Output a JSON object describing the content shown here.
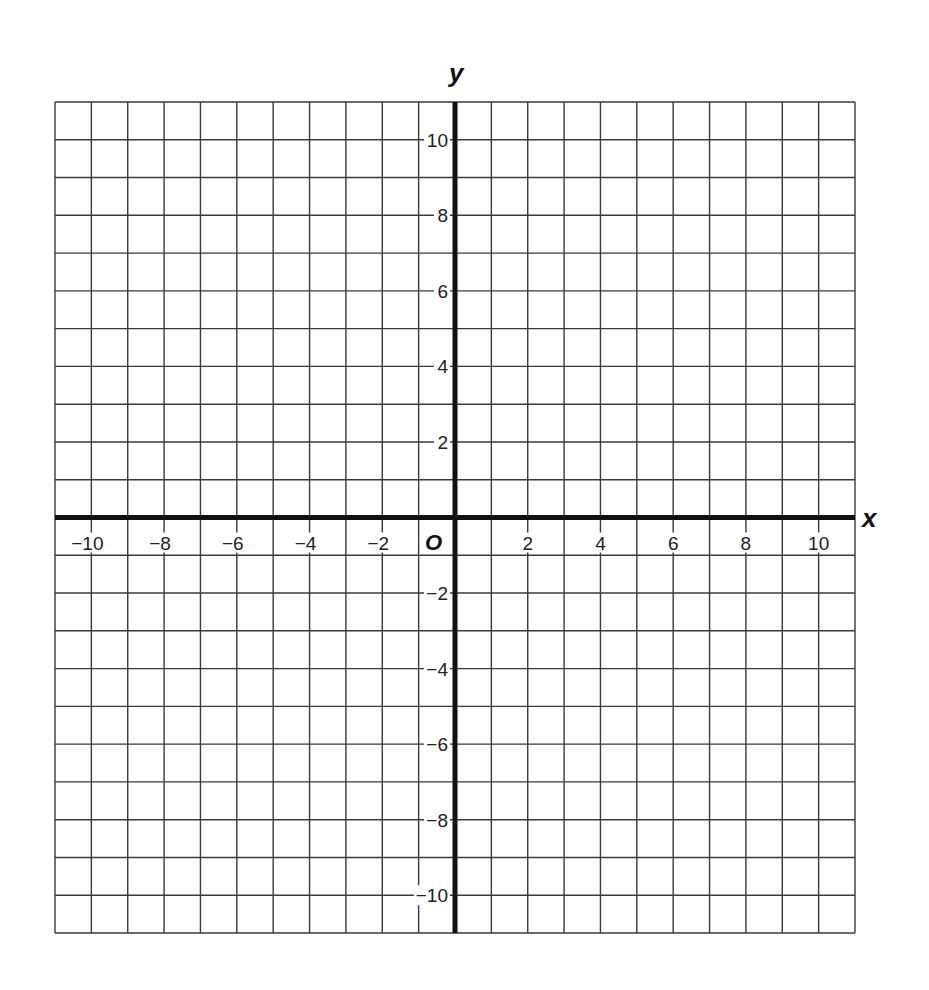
{
  "chart_data": {
    "type": "scatter",
    "title": "",
    "xlabel": "x",
    "ylabel": "y",
    "origin_label": "O",
    "xlim": [
      -11,
      11
    ],
    "ylim": [
      -11,
      11
    ],
    "grid": true,
    "grid_step": 1,
    "x_ticks": [
      -10,
      -8,
      -6,
      -4,
      -2,
      2,
      4,
      6,
      8,
      10
    ],
    "y_ticks": [
      10,
      8,
      6,
      4,
      2,
      -2,
      -4,
      -6,
      -8,
      -10
    ],
    "x_tick_labels": [
      "−10",
      "−8",
      "−6",
      "−4",
      "−2",
      "2",
      "4",
      "6",
      "8",
      "10"
    ],
    "y_tick_labels": [
      "10",
      "8",
      "6",
      "4",
      "2",
      "−2",
      "−4",
      "−6",
      "−8",
      "−10"
    ],
    "series": [],
    "legend": null,
    "colors": {
      "grid": "#3a3a3a",
      "axis": "#111111",
      "background": "#ffffff"
    }
  },
  "layout": {
    "left": 55,
    "right": 855,
    "top": 102,
    "bottom": 933,
    "origin_x": 455,
    "origin_y": 518
  }
}
